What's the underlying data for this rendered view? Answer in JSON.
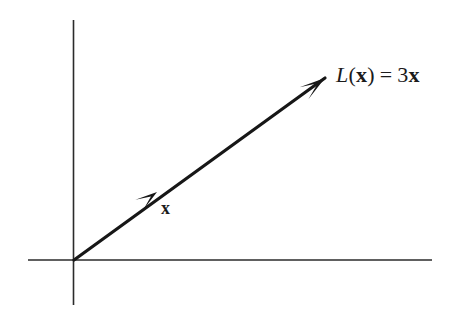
{
  "figure": {
    "name": "linear-transformation-scaling-diagram",
    "caption_free": true,
    "background_color": "#ffffff",
    "width": 455,
    "height": 323
  },
  "axes": {
    "color": "#2b2b2b",
    "stroke_width": 1.6,
    "origin": {
      "x": 74,
      "y": 260
    },
    "horizontal": {
      "x1": 28,
      "y1": 260,
      "x2": 432,
      "y2": 260
    },
    "vertical": {
      "x1": 73.5,
      "y1": 20,
      "x2": 73.5,
      "y2": 305
    }
  },
  "vectors": {
    "color": "#171717",
    "stroke_width": 3.2,
    "ray": {
      "name": "transformed-vector-ray",
      "x1": 74,
      "y1": 260,
      "x2": 325,
      "y2": 78
    },
    "head_main": {
      "name": "arrowhead-Lx",
      "tip_x": 325,
      "tip_y": 78,
      "length": 26,
      "half_width": 7.5
    },
    "head_mid": {
      "name": "arrowhead-x",
      "tip_x": 157,
      "tip_y": 192,
      "length": 22,
      "half_width": 6.5
    }
  },
  "labels": {
    "transform": {
      "full_text": "L(x) = 3x",
      "function_name": "L",
      "open_paren": "(",
      "argument": "x",
      "close_paren": ")",
      "equals": "=",
      "scalar": "3",
      "result_vector": "x"
    },
    "vector_x": {
      "text": "x"
    }
  },
  "chart_data": {
    "type": "scatter",
    "title": "",
    "xlabel": "",
    "ylabel": "",
    "grid": false,
    "legend": "none",
    "xlim": [
      -0.55,
      4.3
    ],
    "ylim": [
      -0.48,
      3.05
    ],
    "series": [
      {
        "name": "x",
        "kind": "arrow",
        "start": [
          0,
          0
        ],
        "end": [
          1,
          0.725
        ],
        "label": "x"
      },
      {
        "name": "L(x) = 3x",
        "kind": "arrow",
        "start": [
          0,
          0
        ],
        "end": [
          3,
          2.175
        ],
        "label": "L(x) = 3x"
      }
    ],
    "annotations": [
      {
        "text": "x",
        "x": 1.05,
        "y": 0.6
      },
      {
        "text": "L(x) = 3x",
        "x": 3.15,
        "y": 2.2
      }
    ]
  }
}
